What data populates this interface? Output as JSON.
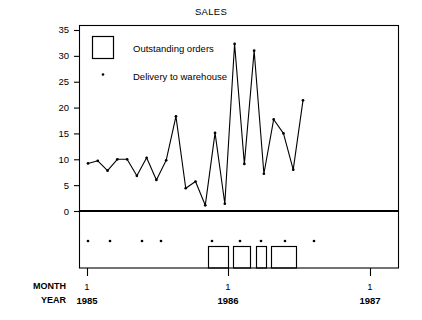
{
  "chart_data": {
    "type": "line",
    "title": "SALES",
    "xlabel": "",
    "ylabel": "",
    "ylim": [
      0,
      35
    ],
    "yticks": [
      0,
      5,
      10,
      15,
      20,
      25,
      30,
      35
    ],
    "grid": false,
    "legend_position": "top-left",
    "series": [
      {
        "name": "Sales",
        "marker": "dot",
        "values": [
          9.2,
          9.7,
          7.8,
          10.0,
          10.0,
          6.8,
          10.3,
          6.0,
          9.8,
          18.3,
          4.4,
          5.7,
          1.1,
          15.1,
          1.4,
          32.3,
          9.1,
          31.0,
          7.2,
          17.7,
          15.0,
          8.0,
          21.4
        ]
      },
      {
        "name": "Outstanding orders",
        "type": "bar",
        "indices": [
          9,
          12,
          15,
          18
        ],
        "spans": [
          [
            208,
            228
          ],
          [
            233,
            250
          ],
          [
            256,
            266
          ],
          [
            271,
            296
          ]
        ]
      },
      {
        "name": "Delivery to warehouse",
        "type": "event-dots",
        "positions": [
          88,
          110,
          142,
          161,
          212,
          240,
          261,
          285,
          314
        ]
      }
    ],
    "axis_row_labels": [
      "MONTH",
      "YEAR"
    ],
    "xtick_months": [
      "1",
      "1",
      "1"
    ],
    "xtick_years": [
      "1985",
      "1986",
      "1987"
    ],
    "xtick_positions": [
      87,
      228,
      370
    ]
  },
  "legend": {
    "items": [
      {
        "label": "Outstanding orders",
        "marker": "box"
      },
      {
        "label": "Delivery to warehouse",
        "marker": "dot"
      }
    ]
  },
  "colors": {
    "line": "#000000",
    "frame": "#000000",
    "background": "#ffffff"
  }
}
